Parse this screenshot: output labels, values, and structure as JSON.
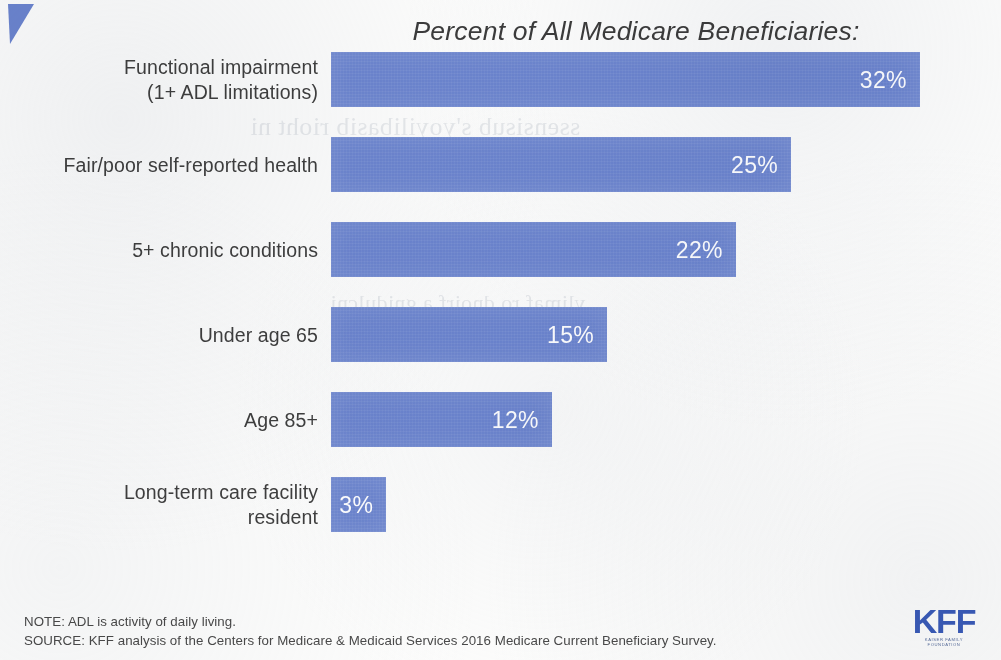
{
  "header": {
    "title": "Percent of All Medicare Beneficiaries:"
  },
  "corner_mark": "blue-triangle-flag",
  "bleed_through": {
    "line1": "ssensisub s'yoyilibasib rioht ni",
    "line2": "ylimaf ro dnoirf a gnidulcni"
  },
  "chart_data": {
    "type": "bar",
    "orientation": "horizontal",
    "title": "Percent of All Medicare Beneficiaries:",
    "xlabel": "",
    "ylabel": "",
    "xlim": [
      0,
      34
    ],
    "grid": false,
    "legend": "none",
    "value_label_position": "inside-end",
    "bar_color": "#6c85cf",
    "value_label_color": "#ffffff",
    "categories": [
      "Functional impairment (1+ ADL limitations)",
      "Fair/poor self-reported health",
      "5+ chronic conditions",
      "Under age 65",
      "Age 85+",
      "Long-term care facility resident"
    ],
    "values": [
      32,
      25,
      22,
      15,
      12,
      3
    ],
    "value_labels": [
      "32%",
      "25%",
      "22%",
      "15%",
      "12%",
      "3%"
    ]
  },
  "bars": [
    {
      "label_line1": "Functional impairment",
      "label_line2": "(1+ ADL limitations)",
      "value": 32,
      "value_label": "32%"
    },
    {
      "label_line1": "Fair/poor self-reported health",
      "label_line2": "",
      "value": 25,
      "value_label": "25%"
    },
    {
      "label_line1": "5+ chronic conditions",
      "label_line2": "",
      "value": 22,
      "value_label": "22%"
    },
    {
      "label_line1": "Under age 65",
      "label_line2": "",
      "value": 15,
      "value_label": "15%"
    },
    {
      "label_line1": "Age 85+",
      "label_line2": "",
      "value": 12,
      "value_label": "12%"
    },
    {
      "label_line1": "Long-term care facility",
      "label_line2": "resident",
      "value": 3,
      "value_label": "3%"
    }
  ],
  "footer": {
    "note": "NOTE: ADL is activity of daily living.",
    "source": "SOURCE: KFF analysis of the Centers for Medicare & Medicaid Services 2016 Medicare Current Beneficiary Survey."
  },
  "logo": {
    "wordmark": "KFF",
    "sub_line1": "KAISER FAMILY",
    "sub_line2": "FOUNDATION"
  },
  "colors": {
    "bar": "#6c85cf",
    "logo": "#3a5bb8",
    "text": "#3f3f3f",
    "background": "#fdfdfc"
  }
}
